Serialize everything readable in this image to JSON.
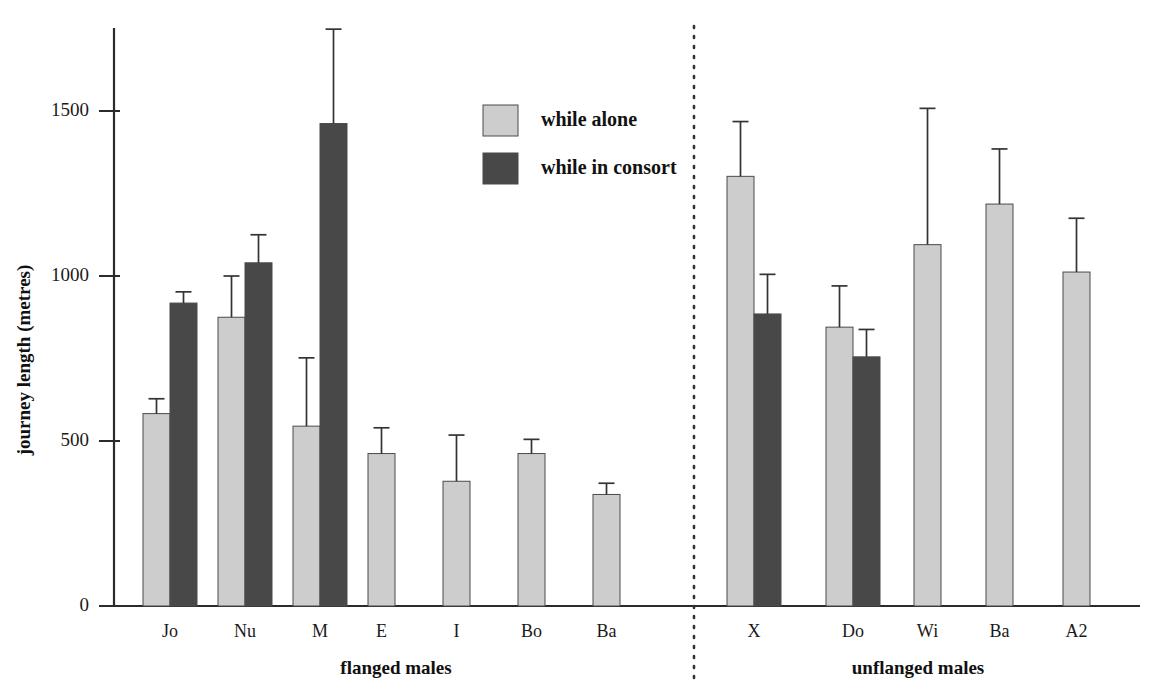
{
  "chart_data": {
    "type": "bar",
    "title": "",
    "subtitle": "",
    "xlabel": "",
    "ylabel": "journey length (metres)",
    "ylim": [
      0,
      1800
    ],
    "yticks": [
      0,
      500,
      1000,
      1500
    ],
    "ytick_labels": [
      "0",
      "500",
      "1000",
      "1500"
    ],
    "grid": false,
    "legend_position": "top-center",
    "error_bars": "upper only (SE)",
    "categories": [
      "Jo",
      "Nu",
      "M",
      "E",
      "I",
      "Bo",
      "Ba",
      "X",
      "Do",
      "Wi",
      "Ba",
      "A2"
    ],
    "series": [
      {
        "name": "while alone",
        "color": "#cdcdcd",
        "values": [
          583,
          875,
          545,
          462,
          378,
          462,
          338,
          1302,
          845,
          1095,
          1218,
          1012
        ],
        "errors_upper": [
          628,
          1000,
          752,
          540,
          518,
          505,
          372,
          1468,
          970,
          1508,
          1385,
          1175
        ]
      },
      {
        "name": "while in consort",
        "color": "#484848",
        "values": [
          918,
          1040,
          1462,
          null,
          null,
          null,
          null,
          885,
          755,
          null,
          null,
          null
        ],
        "errors_upper": [
          952,
          1125,
          1748,
          null,
          null,
          null,
          null,
          1005,
          838,
          null,
          null,
          null
        ]
      }
    ],
    "groups": [
      {
        "label": "flanged males",
        "categories": [
          "Jo",
          "Nu",
          "M",
          "E",
          "I",
          "Bo",
          "Ba"
        ]
      },
      {
        "label": "unflanged males",
        "categories": [
          "X",
          "Do",
          "Wi",
          "Ba",
          "A2"
        ]
      }
    ],
    "legend": [
      {
        "label": "while alone",
        "color": "#cdcdcd"
      },
      {
        "label": "while in consort",
        "color": "#484848"
      }
    ],
    "colors": {
      "alone": "#cdcdcd",
      "consort": "#484848",
      "axis": "#2b2b2b",
      "divider": "#333333",
      "text": "#1a1a1a",
      "background": "#ffffff"
    }
  }
}
